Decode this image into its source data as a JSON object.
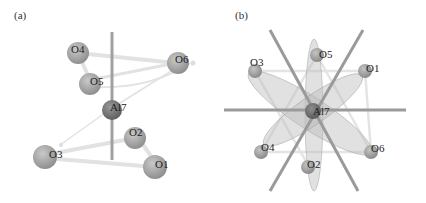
{
  "figure": {
    "panels": [
      {
        "label": "(a)",
        "atoms": {
          "center": "Al7",
          "oxygens": [
            "O1",
            "O2",
            "O3",
            "O4",
            "O5",
            "O6"
          ]
        }
      },
      {
        "label": "(b)",
        "atoms": {
          "center": "Al7",
          "oxygens": [
            "O1",
            "O2",
            "O3",
            "O4",
            "O5",
            "O6"
          ]
        }
      }
    ]
  },
  "labels": {
    "a": {
      "panel": "(a)",
      "O4": "O4",
      "O5": "O5",
      "O6": "O6",
      "Al7": "Al7",
      "O2": "O2",
      "O3": "O3",
      "O1": "O1"
    },
    "b": {
      "panel": "(b)",
      "O5": "O5",
      "O3": "O3",
      "O1": "O1",
      "Al7": "Al7",
      "O4": "O4",
      "O6": "O6",
      "O2": "O2"
    }
  },
  "colors": {
    "oxygen": "#a8a8a8",
    "aluminum": "#7a7a7a",
    "axis": "#9a9a9a",
    "bond": "#e0e0e0",
    "ellipse": "#bdbdbd"
  }
}
